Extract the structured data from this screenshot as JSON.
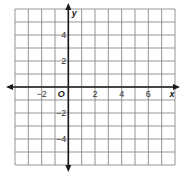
{
  "chart_data": {
    "type": "scatter",
    "title": "",
    "xlabel": "x",
    "ylabel": "y",
    "origin_label": "O",
    "xlim": [
      -4,
      8
    ],
    "ylim": [
      -6,
      6
    ],
    "grid": true,
    "grid_step": 1,
    "x_ticks": [
      {
        "value": -2,
        "label": "−2"
      },
      {
        "value": 2,
        "label": "2"
      },
      {
        "value": 4,
        "label": "4"
      },
      {
        "value": 6,
        "label": "6"
      }
    ],
    "y_ticks": [
      {
        "value": 4,
        "label": "4"
      },
      {
        "value": 2,
        "label": "2"
      },
      {
        "value": -2,
        "label": "−2"
      },
      {
        "value": -4,
        "label": "−4"
      }
    ],
    "points": [],
    "legend": null
  },
  "colors": {
    "background": "#ffffff",
    "grid": "#8a8a8a",
    "axis": "#1a1a1a",
    "text": "#333333"
  },
  "layout": {
    "left": 15,
    "top": 9,
    "width": 160,
    "height": 156
  }
}
